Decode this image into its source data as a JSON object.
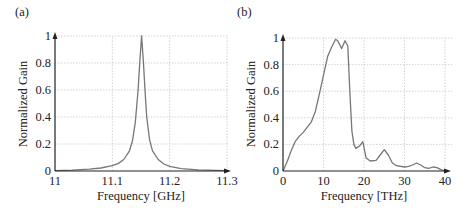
{
  "chart_data": [
    {
      "panel": "(a)",
      "type": "line",
      "title": "",
      "xlabel": "Frequency [GHz]",
      "ylabel": "Normalized Gain",
      "xlim": [
        11,
        11.3
      ],
      "ylim": [
        0,
        1
      ],
      "xticks": [
        "11",
        "11.1",
        "11.2",
        "11.3"
      ],
      "yticks": [
        "0",
        "0.2",
        "0.4",
        "0.6",
        "0.8",
        "1"
      ],
      "grid": true,
      "legend": null,
      "series": [
        {
          "name": "Normalized Gain",
          "x": [
            11.0,
            11.03,
            11.06,
            11.08,
            11.1,
            11.11,
            11.12,
            11.13,
            11.135,
            11.14,
            11.145,
            11.148,
            11.151,
            11.154,
            11.157,
            11.16,
            11.165,
            11.17,
            11.18,
            11.19,
            11.2,
            11.22,
            11.25,
            11.28,
            11.3
          ],
          "y": [
            0.003,
            0.007,
            0.013,
            0.022,
            0.04,
            0.055,
            0.085,
            0.15,
            0.22,
            0.36,
            0.6,
            0.82,
            1.0,
            0.82,
            0.6,
            0.4,
            0.23,
            0.15,
            0.085,
            0.052,
            0.035,
            0.018,
            0.009,
            0.005,
            0.003
          ]
        }
      ]
    },
    {
      "panel": "(b)",
      "type": "line",
      "title": "",
      "xlabel": "Frequency [THz]",
      "ylabel": "Normalized Gain",
      "xlim": [
        0,
        40
      ],
      "ylim": [
        0,
        1
      ],
      "xticks": [
        "0",
        "10",
        "20",
        "30",
        "40"
      ],
      "yticks": [
        "0",
        "0.2",
        "0.4",
        "0.6",
        "0.8",
        "1"
      ],
      "grid": true,
      "legend": null,
      "series": [
        {
          "name": "Normalized Gain",
          "x": [
            0,
            1,
            2,
            3,
            4,
            5,
            6,
            7,
            8,
            9,
            10,
            11,
            12,
            13,
            13.5,
            14.5,
            15.3,
            16,
            16.5,
            17,
            17.5,
            18,
            19,
            19.7,
            20.5,
            21.5,
            23,
            24,
            25,
            26,
            27,
            28,
            30,
            31,
            32,
            33,
            34,
            35,
            36,
            37,
            38,
            39,
            40
          ],
          "y": [
            0,
            0.07,
            0.15,
            0.22,
            0.26,
            0.29,
            0.33,
            0.37,
            0.45,
            0.58,
            0.72,
            0.86,
            0.93,
            0.99,
            0.98,
            0.92,
            0.98,
            0.94,
            0.6,
            0.3,
            0.2,
            0.17,
            0.19,
            0.22,
            0.1,
            0.075,
            0.08,
            0.12,
            0.16,
            0.12,
            0.06,
            0.04,
            0.03,
            0.035,
            0.045,
            0.06,
            0.045,
            0.025,
            0.02,
            0.03,
            0.025,
            0.01,
            0.0
          ]
        }
      ]
    }
  ],
  "panels": [
    {
      "label": "(a)",
      "xlabel": "Frequency [GHz]",
      "ylabel": "Normalized Gain"
    },
    {
      "label": "(b)",
      "xlabel": "Frequency [THz]",
      "ylabel": "Normalized Gain"
    }
  ],
  "colors": {
    "curve": "#777777",
    "axis": "#222222",
    "grid": "#c8c8c8"
  }
}
